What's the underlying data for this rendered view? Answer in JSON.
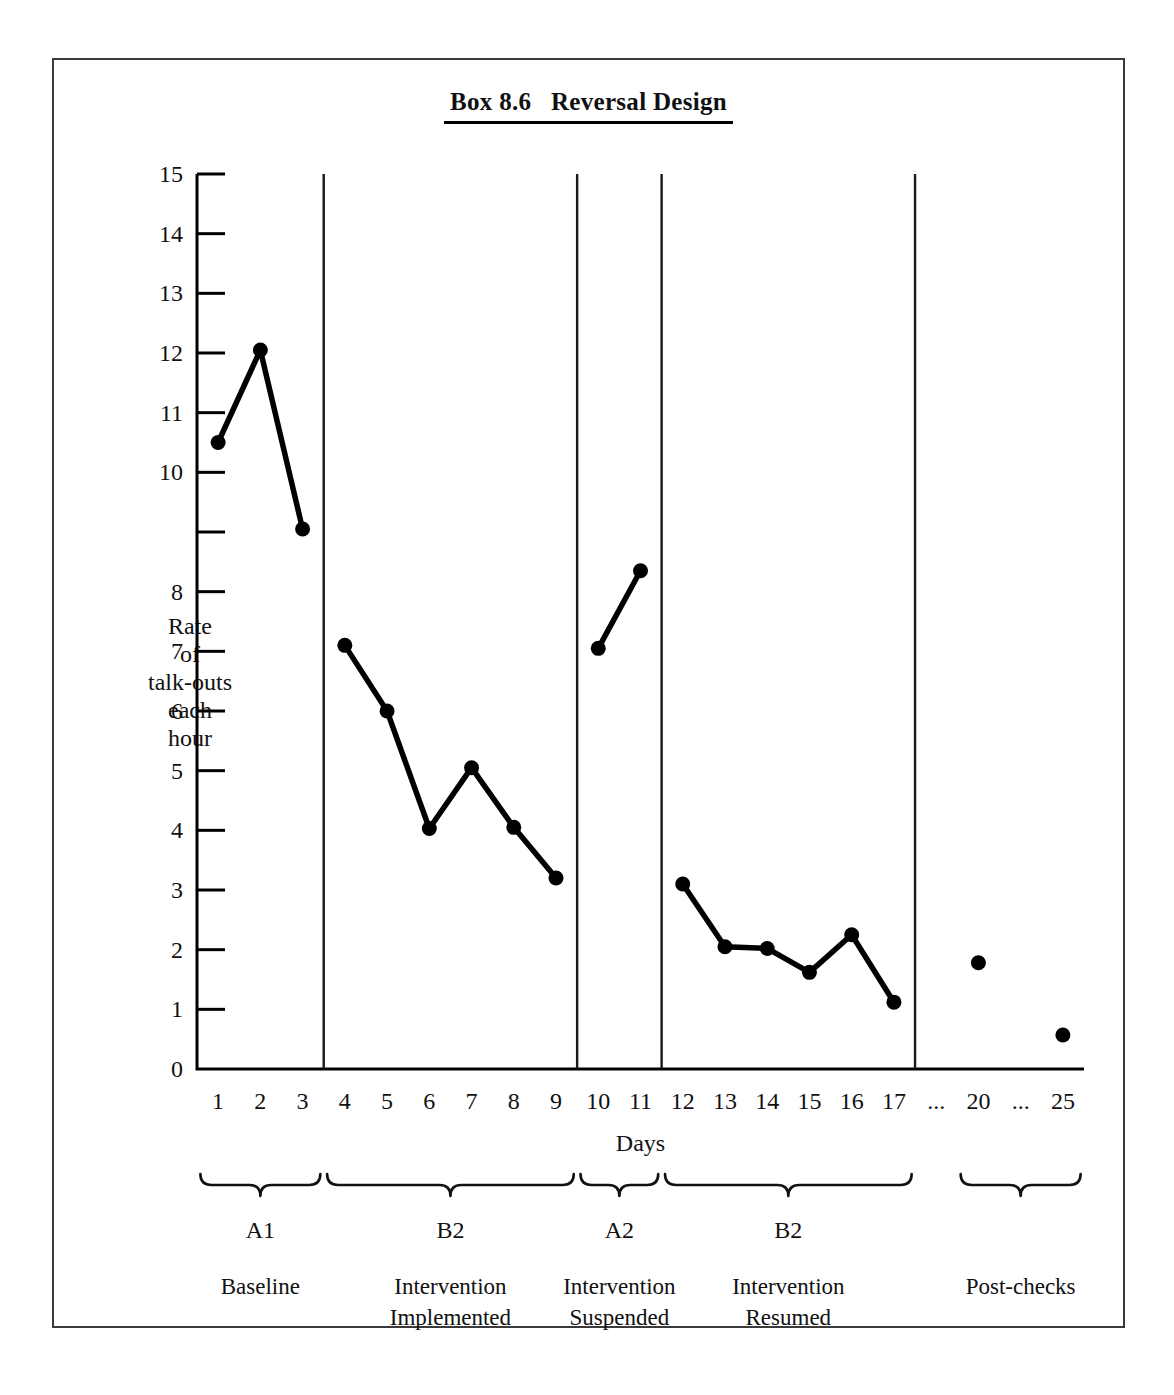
{
  "figure": {
    "title": "Box 8.6   Reversal Design",
    "ylabel_lines": [
      "Rate",
      "of",
      "talk-outs",
      "each",
      "hour"
    ],
    "xlabel": "Days"
  },
  "chart_data": {
    "type": "line",
    "title": "Box 8.6   Reversal Design",
    "xlabel": "Days",
    "ylabel": "Rate of talk-outs each hour",
    "ylim": [
      0,
      15
    ],
    "yticks": [
      0,
      1,
      2,
      3,
      4,
      5,
      6,
      7,
      8,
      9,
      10,
      11,
      12,
      13,
      14,
      15
    ],
    "ytick_labels": [
      "0",
      "1",
      "2",
      "3",
      "4",
      "5",
      "6",
      "7",
      "8",
      "",
      "10",
      "11",
      "12",
      "13",
      "14",
      "15"
    ],
    "xtick_labels": [
      "1",
      "2",
      "3",
      "4",
      "5",
      "6",
      "7",
      "8",
      "9",
      "10",
      "11",
      "12",
      "13",
      "14",
      "15",
      "16",
      "17",
      "...",
      "20",
      "...",
      "25"
    ],
    "grid": false,
    "legend": "none",
    "series": [
      {
        "name": "A1 Baseline",
        "x": [
          1,
          2,
          3
        ],
        "values": [
          10.5,
          12.05,
          9.05
        ],
        "connected": true
      },
      {
        "name": "B2 Intervention Implemented",
        "x": [
          4,
          5,
          6,
          7,
          8,
          9
        ],
        "values": [
          7.1,
          6.0,
          4.03,
          5.05,
          4.05,
          3.2
        ],
        "connected": true
      },
      {
        "name": "A2 Intervention Suspended",
        "x": [
          10,
          11
        ],
        "values": [
          7.05,
          8.35
        ],
        "connected": true
      },
      {
        "name": "B2 Intervention Resumed",
        "x": [
          12,
          13,
          14,
          15,
          16,
          17
        ],
        "values": [
          3.1,
          2.05,
          2.02,
          1.62,
          2.25,
          1.12
        ],
        "connected": true
      },
      {
        "name": "Post-checks",
        "x": [
          20,
          25
        ],
        "values": [
          1.78,
          0.57
        ],
        "connected": false
      }
    ],
    "phase_dividers_after_day": [
      3,
      9,
      11,
      17
    ],
    "phases": [
      {
        "code": "A1",
        "desc_lines": [
          "Baseline"
        ],
        "first_day": 1,
        "last_day": 3
      },
      {
        "code": "B2",
        "desc_lines": [
          "Intervention",
          "Implemented"
        ],
        "first_day": 4,
        "last_day": 9
      },
      {
        "code": "A2",
        "desc_lines": [
          "Intervention",
          "Suspended"
        ],
        "first_day": 10,
        "last_day": 11
      },
      {
        "code": "B2",
        "desc_lines": [
          "Intervention",
          "Resumed"
        ],
        "first_day": 12,
        "last_day": 17
      },
      {
        "code": "",
        "desc_lines": [
          "Post-checks"
        ],
        "first_day": 20,
        "last_day": 25
      }
    ],
    "colors": {
      "ink": "#000000",
      "frame": "#3a3a3a",
      "background": "#ffffff"
    }
  }
}
